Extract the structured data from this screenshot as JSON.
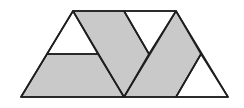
{
  "diagram": {
    "colors": {
      "shaded": "#c9c9c9",
      "unshaded": "#ffffff",
      "stroke": "#1e1e1e"
    },
    "outline": {
      "points": "21,97 73,11 176,11 228,97"
    },
    "regions": [
      {
        "name": "top-left-triangle",
        "fill": "unshaded",
        "points": "73,11 47,54 98,54"
      },
      {
        "name": "bottom-left-trapezoid",
        "fill": "shaded",
        "points": "47,54 98,54 124,97 21,97"
      },
      {
        "name": "middle-left-parallelogram",
        "fill": "shaded",
        "points": "73,11 124,11 149,54 124,97"
      },
      {
        "name": "top-middle-triangle",
        "fill": "unshaded",
        "points": "124,11 176,11 149,54"
      },
      {
        "name": "middle-right-parallelogram",
        "fill": "shaded",
        "points": "176,11 201,54 176,97 124,97"
      },
      {
        "name": "bottom-right-triangle",
        "fill": "unshaded",
        "points": "201,54 228,97 176,97"
      }
    ],
    "shaded_count": 3,
    "unshaded_count": 3
  }
}
